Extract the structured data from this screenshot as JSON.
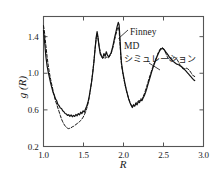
{
  "figure": {
    "background": "#ffffff",
    "frame_color": "#555555",
    "curve_color": "#111111"
  },
  "axes": {
    "x_label": "R",
    "y_label": "g (R)",
    "x_ticks": [
      "1.0",
      "1.5",
      "2.0",
      "2.5",
      "3.0"
    ],
    "y_ticks": [
      "1.4",
      "1.0",
      "0.6",
      "0.2"
    ]
  },
  "annotations": {
    "finney": "Finney",
    "md": "MD",
    "simulation": "シミュレーション"
  },
  "chart_data": {
    "type": "line",
    "title": "",
    "xlabel": "R",
    "ylabel": "g (R)",
    "xlim": [
      1.0,
      3.0
    ],
    "ylim": [
      0.2,
      1.62
    ],
    "grid": false,
    "legend_position": "inline-annotation",
    "x_ticks": [
      1.0,
      1.5,
      2.0,
      2.5,
      3.0
    ],
    "y_ticks": [
      0.2,
      0.6,
      1.0,
      1.4
    ],
    "series": [
      {
        "name": "MD シミュレーション",
        "style": "solid",
        "color": "#111111",
        "points": [
          [
            1.0,
            1.47
          ],
          [
            1.015,
            1.33
          ],
          [
            1.03,
            1.18
          ],
          [
            1.045,
            1.08
          ],
          [
            1.06,
            1.01
          ],
          [
            1.075,
            0.95
          ],
          [
            1.09,
            0.89
          ],
          [
            1.105,
            0.84
          ],
          [
            1.12,
            0.79
          ],
          [
            1.135,
            0.76
          ],
          [
            1.15,
            0.72
          ],
          [
            1.165,
            0.7
          ],
          [
            1.18,
            0.66
          ],
          [
            1.195,
            0.645
          ],
          [
            1.21,
            0.62
          ],
          [
            1.225,
            0.615
          ],
          [
            1.24,
            0.59
          ],
          [
            1.255,
            0.58
          ],
          [
            1.27,
            0.56
          ],
          [
            1.285,
            0.555
          ],
          [
            1.3,
            0.54
          ],
          [
            1.315,
            0.548
          ],
          [
            1.33,
            0.53
          ],
          [
            1.345,
            0.545
          ],
          [
            1.36,
            0.525
          ],
          [
            1.375,
            0.54
          ],
          [
            1.39,
            0.528
          ],
          [
            1.405,
            0.55
          ],
          [
            1.42,
            0.535
          ],
          [
            1.435,
            0.56
          ],
          [
            1.45,
            0.545
          ],
          [
            1.465,
            0.575
          ],
          [
            1.48,
            0.56
          ],
          [
            1.495,
            0.59
          ],
          [
            1.51,
            0.575
          ],
          [
            1.525,
            0.61
          ],
          [
            1.54,
            0.64
          ],
          [
            1.555,
            0.68
          ],
          [
            1.57,
            0.74
          ],
          [
            1.585,
            0.82
          ],
          [
            1.6,
            0.9
          ],
          [
            1.615,
            1.0
          ],
          [
            1.63,
            1.12
          ],
          [
            1.645,
            1.27
          ],
          [
            1.66,
            1.4
          ],
          [
            1.67,
            1.455
          ],
          [
            1.68,
            1.4
          ],
          [
            1.695,
            1.29
          ],
          [
            1.71,
            1.21
          ],
          [
            1.725,
            1.185
          ],
          [
            1.74,
            1.165
          ],
          [
            1.755,
            1.215
          ],
          [
            1.77,
            1.185
          ],
          [
            1.785,
            1.235
          ],
          [
            1.8,
            1.195
          ],
          [
            1.815,
            1.18
          ],
          [
            1.83,
            1.2
          ],
          [
            1.845,
            1.225
          ],
          [
            1.86,
            1.27
          ],
          [
            1.875,
            1.33
          ],
          [
            1.89,
            1.395
          ],
          [
            1.905,
            1.45
          ],
          [
            1.92,
            1.51
          ],
          [
            1.935,
            1.555
          ],
          [
            1.945,
            1.53
          ],
          [
            1.955,
            1.39
          ],
          [
            1.965,
            1.23
          ],
          [
            1.975,
            1.11
          ],
          [
            1.99,
            1.02
          ],
          [
            2.005,
            0.95
          ],
          [
            2.02,
            0.88
          ],
          [
            2.035,
            0.82
          ],
          [
            2.05,
            0.77
          ],
          [
            2.065,
            0.72
          ],
          [
            2.08,
            0.68
          ],
          [
            2.095,
            0.65
          ],
          [
            2.11,
            0.625
          ],
          [
            2.125,
            0.65
          ],
          [
            2.14,
            0.64
          ],
          [
            2.155,
            0.67
          ],
          [
            2.17,
            0.655
          ],
          [
            2.185,
            0.69
          ],
          [
            2.2,
            0.68
          ],
          [
            2.215,
            0.71
          ],
          [
            2.23,
            0.7
          ],
          [
            2.245,
            0.73
          ],
          [
            2.26,
            0.755
          ],
          [
            2.275,
            0.79
          ],
          [
            2.29,
            0.83
          ],
          [
            2.305,
            0.875
          ],
          [
            2.32,
            0.92
          ],
          [
            2.335,
            0.965
          ],
          [
            2.35,
            1.01
          ],
          [
            2.365,
            1.05
          ],
          [
            2.38,
            1.09
          ],
          [
            2.395,
            1.125
          ],
          [
            2.41,
            1.16
          ],
          [
            2.425,
            1.195
          ],
          [
            2.44,
            1.225
          ],
          [
            2.455,
            1.25
          ],
          [
            2.47,
            1.265
          ],
          [
            2.485,
            1.272
          ],
          [
            2.5,
            1.265
          ],
          [
            2.515,
            1.25
          ],
          [
            2.53,
            1.23
          ],
          [
            2.545,
            1.215
          ],
          [
            2.56,
            1.195
          ],
          [
            2.575,
            1.175
          ],
          [
            2.59,
            1.16
          ],
          [
            2.605,
            1.145
          ],
          [
            2.62,
            1.13
          ],
          [
            2.635,
            1.12
          ],
          [
            2.65,
            1.11
          ],
          [
            2.665,
            1.1
          ],
          [
            2.68,
            1.095
          ],
          [
            2.695,
            1.09
          ],
          [
            2.71,
            1.08
          ],
          [
            2.725,
            1.075
          ],
          [
            2.74,
            1.06
          ],
          [
            2.755,
            1.05
          ],
          [
            2.77,
            1.035
          ],
          [
            2.785,
            1.02
          ],
          [
            2.8,
            1.005
          ],
          [
            2.815,
            0.99
          ],
          [
            2.83,
            0.975
          ],
          [
            2.845,
            0.96
          ],
          [
            2.86,
            0.945
          ],
          [
            2.875,
            0.93
          ],
          [
            2.89,
            0.92
          ]
        ]
      },
      {
        "name": "Finney",
        "style": "dashed",
        "color": "#111111",
        "points": [
          [
            1.0,
            1.52
          ],
          [
            1.015,
            1.43
          ],
          [
            1.03,
            1.3
          ],
          [
            1.045,
            1.18
          ],
          [
            1.06,
            1.08
          ],
          [
            1.075,
            1.0
          ],
          [
            1.09,
            0.93
          ],
          [
            1.105,
            0.87
          ],
          [
            1.12,
            0.81
          ],
          [
            1.135,
            0.75
          ],
          [
            1.15,
            0.7
          ],
          [
            1.165,
            0.66
          ],
          [
            1.18,
            0.62
          ],
          [
            1.195,
            0.58
          ],
          [
            1.21,
            0.54
          ],
          [
            1.225,
            0.5
          ],
          [
            1.24,
            0.47
          ],
          [
            1.255,
            0.445
          ],
          [
            1.27,
            0.425
          ],
          [
            1.285,
            0.41
          ],
          [
            1.3,
            0.4
          ],
          [
            1.315,
            0.395
          ],
          [
            1.33,
            0.4
          ],
          [
            1.345,
            0.405
          ],
          [
            1.36,
            0.415
          ],
          [
            1.375,
            0.42
          ],
          [
            1.39,
            0.43
          ],
          [
            1.405,
            0.44
          ],
          [
            1.42,
            0.45
          ],
          [
            1.435,
            0.46
          ],
          [
            1.45,
            0.47
          ],
          [
            1.465,
            0.485
          ],
          [
            1.48,
            0.5
          ],
          [
            1.495,
            0.52
          ],
          [
            1.51,
            0.545
          ],
          [
            1.525,
            0.575
          ],
          [
            1.54,
            0.615
          ],
          [
            1.555,
            0.665
          ],
          [
            1.57,
            0.73
          ],
          [
            1.585,
            0.81
          ],
          [
            1.6,
            0.9
          ],
          [
            1.615,
            1.01
          ],
          [
            1.63,
            1.13
          ],
          [
            1.645,
            1.27
          ],
          [
            1.66,
            1.39
          ],
          [
            1.67,
            1.43
          ],
          [
            1.68,
            1.39
          ],
          [
            1.695,
            1.3
          ],
          [
            1.71,
            1.23
          ],
          [
            1.725,
            1.19
          ],
          [
            1.74,
            1.165
          ],
          [
            1.755,
            1.175
          ],
          [
            1.77,
            1.16
          ],
          [
            1.785,
            1.18
          ],
          [
            1.8,
            1.165
          ],
          [
            1.815,
            1.17
          ],
          [
            1.83,
            1.19
          ],
          [
            1.845,
            1.215
          ],
          [
            1.86,
            1.255
          ],
          [
            1.875,
            1.31
          ],
          [
            1.89,
            1.37
          ],
          [
            1.905,
            1.425
          ],
          [
            1.92,
            1.475
          ],
          [
            1.935,
            1.505
          ],
          [
            1.945,
            1.47
          ],
          [
            1.955,
            1.34
          ],
          [
            1.965,
            1.2
          ],
          [
            1.975,
            1.09
          ],
          [
            1.99,
            1.005
          ],
          [
            2.005,
            0.935
          ],
          [
            2.02,
            0.87
          ],
          [
            2.035,
            0.815
          ],
          [
            2.05,
            0.765
          ],
          [
            2.065,
            0.72
          ],
          [
            2.08,
            0.685
          ],
          [
            2.095,
            0.655
          ],
          [
            2.11,
            0.635
          ],
          [
            2.125,
            0.66
          ],
          [
            2.14,
            0.65
          ],
          [
            2.155,
            0.68
          ],
          [
            2.17,
            0.67
          ],
          [
            2.185,
            0.7
          ],
          [
            2.2,
            0.695
          ],
          [
            2.215,
            0.72
          ],
          [
            2.23,
            0.715
          ],
          [
            2.245,
            0.745
          ],
          [
            2.26,
            0.775
          ],
          [
            2.275,
            0.815
          ],
          [
            2.29,
            0.855
          ],
          [
            2.305,
            0.9
          ],
          [
            2.32,
            0.945
          ],
          [
            2.335,
            0.985
          ],
          [
            2.35,
            1.025
          ],
          [
            2.365,
            1.065
          ],
          [
            2.38,
            1.1
          ],
          [
            2.395,
            1.135
          ],
          [
            2.41,
            1.17
          ],
          [
            2.425,
            1.205
          ],
          [
            2.44,
            1.235
          ],
          [
            2.455,
            1.26
          ],
          [
            2.47,
            1.275
          ],
          [
            2.485,
            1.28
          ],
          [
            2.5,
            1.27
          ],
          [
            2.515,
            1.245
          ],
          [
            2.53,
            1.215
          ],
          [
            2.545,
            1.185
          ],
          [
            2.56,
            1.16
          ],
          [
            2.575,
            1.145
          ],
          [
            2.59,
            1.14
          ],
          [
            2.605,
            1.15
          ],
          [
            2.62,
            1.165
          ],
          [
            2.635,
            1.175
          ],
          [
            2.65,
            1.17
          ],
          [
            2.665,
            1.155
          ],
          [
            2.68,
            1.135
          ],
          [
            2.695,
            1.11
          ],
          [
            2.71,
            1.085
          ],
          [
            2.725,
            1.065
          ],
          [
            2.74,
            1.05
          ],
          [
            2.755,
            1.045
          ],
          [
            2.77,
            1.05
          ],
          [
            2.785,
            1.055
          ],
          [
            2.8,
            1.05
          ],
          [
            2.815,
            1.04
          ],
          [
            2.83,
            1.025
          ],
          [
            2.845,
            1.005
          ],
          [
            2.86,
            0.985
          ],
          [
            2.875,
            0.97
          ],
          [
            2.89,
            0.965
          ]
        ]
      }
    ],
    "annotations": [
      {
        "text": "Finney",
        "points_to": [
          1.93,
          1.47
        ]
      },
      {
        "text": "MD",
        "points_to": [
          2.45,
          1.22
        ]
      },
      {
        "text": "シミュレーション",
        "points_to": [
          2.45,
          1.22
        ]
      }
    ]
  }
}
